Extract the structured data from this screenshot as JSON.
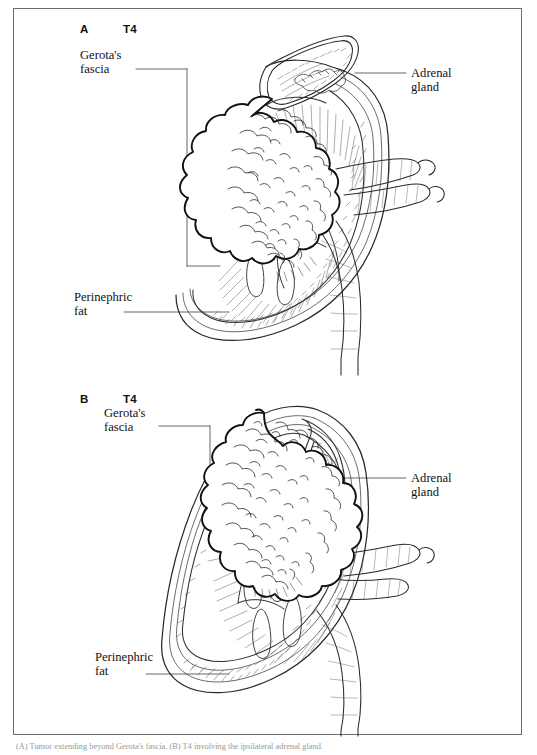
{
  "figure": {
    "background_color": "#ffffff",
    "border_color": "#6e6e6e",
    "ink_color": "#1a1a1a"
  },
  "panels": [
    {
      "id": "A",
      "letter": "A",
      "stage": "T4",
      "annotations": [
        {
          "name": "gerotas-fascia",
          "text": "Gerota's\nfascia"
        },
        {
          "name": "adrenal-gland",
          "text": "Adrenal\ngland"
        },
        {
          "name": "perinephric-fat",
          "text": "Perinephric\nfat"
        }
      ],
      "structures": [
        "tumor-mass-extending-beyond-gerotas-fascia",
        "kidney-cortex",
        "renal-medulla-pyramids",
        "renal-pelvis",
        "adrenal-gland",
        "renal-artery",
        "renal-vein",
        "ureter",
        "perinephric-fat-layer",
        "gerotas-fascia-layer"
      ]
    },
    {
      "id": "B",
      "letter": "B",
      "stage": "T4",
      "annotations": [
        {
          "name": "gerotas-fascia",
          "text": "Gerota's\nfascia"
        },
        {
          "name": "adrenal-gland",
          "text": "Adrenal\ngland"
        },
        {
          "name": "perinephric-fat",
          "text": "Perinephric\nfat"
        }
      ],
      "structures": [
        "tumor-mass-invading-adrenal-gland",
        "kidney-cortex",
        "renal-medulla-pyramids",
        "renal-pelvis",
        "adrenal-gland",
        "renal-artery",
        "renal-vein",
        "ureter",
        "perinephric-fat-layer",
        "gerotas-fascia-layer"
      ]
    }
  ],
  "caption": {
    "text": "(A) Tumor extending beyond Gerota's fascia. (B) T4 involving the ipsilateral adrenal gland.",
    "truncated": true
  }
}
